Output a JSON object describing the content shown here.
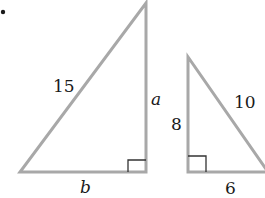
{
  "figure": {
    "marker": "•",
    "colors": {
      "stroke": "#a8a8a8",
      "text": "#1a1a1a",
      "background": "#ffffff"
    },
    "triangles": [
      {
        "name": "large-right-triangle",
        "hypotenuse_label": "15",
        "vertical_leg_label": "a",
        "horizontal_leg_label": "b",
        "right_angle": "bottom-right"
      },
      {
        "name": "small-right-triangle",
        "hypotenuse_label": "10",
        "vertical_leg_label": "8",
        "horizontal_leg_label": "6",
        "right_angle": "bottom-left"
      }
    ]
  }
}
